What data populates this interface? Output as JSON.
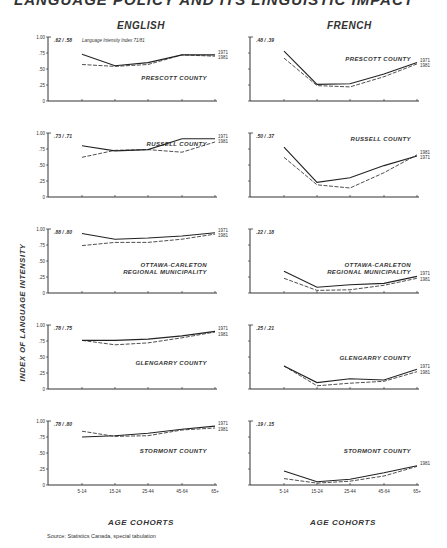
{
  "header": {
    "title": "LANGUAGE POLICY AND ITS LINGUISTIC IMPACT",
    "column_left": "ENGLISH",
    "column_right": "FRENCH",
    "y_axis_title": "INDEX OF LANGUAGE INTENSITY",
    "x_axis_title": "AGE COHORTS",
    "source": "Source: Statistics Canada, special tabulation"
  },
  "chart_data": {
    "type": "line",
    "xlabel": "AGE COHORTS",
    "ylabel": "INDEX OF LANGUAGE INTENSITY",
    "x": [
      "5-14",
      "15-24",
      "25-44",
      "45-64",
      "65+"
    ],
    "yticks": [
      "0",
      ".25",
      ".50",
      ".75",
      "1.00"
    ],
    "ylim": [
      0,
      1
    ],
    "grid": false,
    "legend_note": "Language Intensity Index 71/81",
    "series_styles": {
      "1971": "solid",
      "1981": "dashed"
    },
    "panels": [
      {
        "language": "ENGLISH",
        "region": "PRESCOTT COUNTY",
        "index_label": ".62 / .58",
        "series": [
          {
            "name": "1971",
            "values": [
              0.73,
              0.55,
              0.6,
              0.72,
              0.72
            ]
          },
          {
            "name": "1981",
            "values": [
              0.57,
              0.54,
              0.57,
              0.72,
              0.7
            ]
          }
        ]
      },
      {
        "language": "FRENCH",
        "region": "PRESCOTT COUNTY",
        "index_label": ".48 / .39",
        "series": [
          {
            "name": "1971",
            "values": [
              0.78,
              0.26,
              0.27,
              0.42,
              0.6
            ]
          },
          {
            "name": "1981",
            "values": [
              0.67,
              0.24,
              0.22,
              0.38,
              0.58
            ]
          }
        ]
      },
      {
        "language": "ENGLISH",
        "region": "RUSSELL COUNTY",
        "index_label": ".73 / .71",
        "series": [
          {
            "name": "1971",
            "values": [
              0.8,
              0.72,
              0.74,
              0.91,
              0.91
            ]
          },
          {
            "name": "1981",
            "values": [
              0.62,
              0.73,
              0.74,
              0.7,
              0.86
            ]
          }
        ]
      },
      {
        "language": "FRENCH",
        "region": "RUSSELL COUNTY",
        "index_label": ".50 / .37",
        "series": [
          {
            "name": "1971",
            "values": [
              0.78,
              0.23,
              0.3,
              0.49,
              0.64
            ]
          },
          {
            "name": "1981",
            "values": [
              0.62,
              0.19,
              0.14,
              0.38,
              0.66
            ]
          }
        ]
      },
      {
        "language": "ENGLISH",
        "region": "OTTAWA-CARLETON REGIONAL MUNICIPALITY",
        "index_label": ".88 / .80",
        "series": [
          {
            "name": "1971",
            "values": [
              0.93,
              0.84,
              0.86,
              0.89,
              0.94
            ]
          },
          {
            "name": "1981",
            "values": [
              0.74,
              0.79,
              0.79,
              0.84,
              0.92
            ]
          }
        ]
      },
      {
        "language": "FRENCH",
        "region": "OTTAWA-CARLETON REGIONAL MUNICIPALITY",
        "index_label": ".22 / .18",
        "series": [
          {
            "name": "1971",
            "values": [
              0.34,
              0.09,
              0.13,
              0.15,
              0.26
            ]
          },
          {
            "name": "1981",
            "values": [
              0.23,
              0.04,
              0.05,
              0.12,
              0.23
            ]
          }
        ]
      },
      {
        "language": "ENGLISH",
        "region": "GLENGARRY COUNTY",
        "index_label": ".78 / .75",
        "series": [
          {
            "name": "1971",
            "values": [
              0.76,
              0.76,
              0.78,
              0.83,
              0.9
            ]
          },
          {
            "name": "1981",
            "values": [
              0.76,
              0.69,
              0.72,
              0.8,
              0.89
            ]
          }
        ]
      },
      {
        "language": "FRENCH",
        "region": "GLENGARRY COUNTY",
        "index_label": ".25 / .21",
        "series": [
          {
            "name": "1971",
            "values": [
              0.36,
              0.1,
              0.16,
              0.14,
              0.31
            ]
          },
          {
            "name": "1981",
            "values": [
              0.36,
              0.05,
              0.09,
              0.12,
              0.27
            ]
          }
        ]
      },
      {
        "language": "ENGLISH",
        "region": "STORMONT COUNTY",
        "index_label": ".78 / .80",
        "series": [
          {
            "name": "1971",
            "values": [
              0.75,
              0.77,
              0.81,
              0.87,
              0.92
            ]
          },
          {
            "name": "1981",
            "values": [
              0.84,
              0.76,
              0.77,
              0.86,
              0.89
            ]
          }
        ]
      },
      {
        "language": "FRENCH",
        "region": "STORMONT COUNTY",
        "index_label": ".19 / .15",
        "series": [
          {
            "name": "1971",
            "values": [
              0.22,
              0.05,
              0.09,
              0.19,
              0.3
            ]
          },
          {
            "name": "1981",
            "values": [
              0.1,
              0.03,
              0.06,
              0.14,
              0.29
            ]
          }
        ]
      }
    ]
  },
  "panel_end_labels": {
    "p0": [
      "1971",
      "1981"
    ],
    "p1": [
      "1971",
      "1981"
    ],
    "p2": [
      "1971",
      "1981"
    ],
    "p3": [
      "1981",
      "1971"
    ],
    "p4": [
      "1971",
      "1981"
    ],
    "p5": [
      "1971",
      "1981"
    ],
    "p6": [
      "1971",
      "1981"
    ],
    "p7": [
      "1971",
      "1981"
    ],
    "p8": [
      "1971",
      "1981"
    ],
    "p9": [
      "1981"
    ]
  }
}
